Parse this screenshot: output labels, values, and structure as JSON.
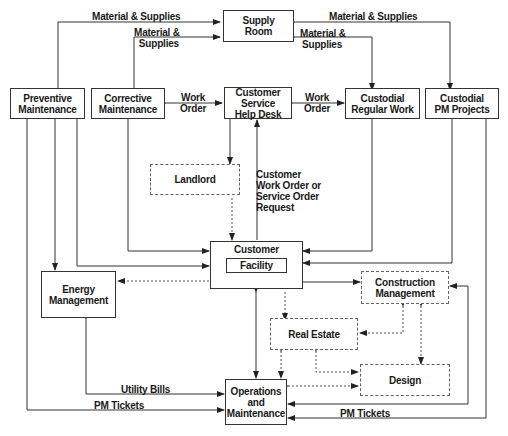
{
  "diagram": {
    "type": "flowchart",
    "nodes": {
      "supply_room": {
        "label_1": "Supply",
        "label_2": "Room",
        "style": "solid"
      },
      "preventive_maintenance": {
        "label_1": "Preventive",
        "label_2": "Maintenance",
        "style": "solid"
      },
      "corrective_maintenance": {
        "label_1": "Corrective",
        "label_2": "Maintenance",
        "style": "solid"
      },
      "help_desk": {
        "label_1": "Customer",
        "label_2": "Service",
        "label_3": "Help  Desk",
        "style": "solid"
      },
      "custodial_regular": {
        "label_1": "Custodial",
        "label_2": "Regular Work",
        "style": "solid"
      },
      "custodial_pm": {
        "label_1": "Custodial",
        "label_2": "PM Projects",
        "style": "solid"
      },
      "landlord": {
        "label": "Landlord",
        "style": "dotted"
      },
      "customer_facility": {
        "label": "Customer",
        "inner_label": "Facility",
        "style": "solid"
      },
      "energy_management": {
        "label_1": "Energy",
        "label_2": "Management",
        "style": "solid"
      },
      "construction_management": {
        "label_1": "Construction",
        "label_2": "Management",
        "style": "dotted"
      },
      "real_estate": {
        "label": "Real Estate",
        "style": "dotted"
      },
      "design": {
        "label": "Design",
        "style": "dotted"
      },
      "operations_maintenance": {
        "label_1": "Operations",
        "label_2": "and",
        "label_3": "Maintenance",
        "style": "solid"
      }
    },
    "edge_labels": {
      "material_supplies_top_left": "Material & Supplies",
      "material_supplies_mid_left_1": "Material &",
      "material_supplies_mid_left_2": "Supplies",
      "material_supplies_top_right": "Material & Supplies",
      "material_supplies_mid_right_1": "Material &",
      "material_supplies_mid_right_2": "Supplies",
      "work_order_left_1": "Work",
      "work_order_left_2": "Order",
      "work_order_right_1": "Work",
      "work_order_right_2": "Order",
      "customer_request_1": "Customer",
      "customer_request_2": "Work Order or",
      "customer_request_3": "Service Order",
      "customer_request_4": "Request",
      "utility_bills": "Utility Bills",
      "pm_tickets_left": "PM  Tickets",
      "pm_tickets_right": "PM  Tickets"
    },
    "edges": [
      {
        "from": "Supply Room",
        "to": "Preventive Maintenance",
        "label": "Material & Supplies",
        "bidirectional": true
      },
      {
        "from": "Supply Room",
        "to": "Corrective Maintenance",
        "label": "Material & Supplies",
        "bidirectional": true
      },
      {
        "from": "Supply Room",
        "to": "Custodial PM Projects",
        "label": "Material & Supplies",
        "bidirectional": true
      },
      {
        "from": "Supply Room",
        "to": "Custodial Regular Work",
        "label": "Material & Supplies",
        "bidirectional": true
      },
      {
        "from": "Corrective Maintenance",
        "to": "Customer Service Help Desk",
        "label": "Work Order",
        "bidirectional": true
      },
      {
        "from": "Customer Service Help Desk",
        "to": "Custodial Regular Work",
        "label": "Work Order",
        "bidirectional": true
      },
      {
        "from": "Customer Service Help Desk",
        "to": "Landlord"
      },
      {
        "from": "Landlord",
        "to": "Customer Facility",
        "dotted": true
      },
      {
        "from": "Customer Facility",
        "to": "Customer Service Help Desk",
        "label": "Customer Work Order or Service Order Request"
      },
      {
        "from": "Corrective Maintenance",
        "to": "Customer Facility"
      },
      {
        "from": "Preventive Maintenance",
        "to": "Customer Facility"
      },
      {
        "from": "Custodial Regular Work",
        "to": "Customer Facility"
      },
      {
        "from": "Custodial PM Projects",
        "to": "Customer Facility"
      },
      {
        "from": "Preventive Maintenance",
        "to": "Energy Management",
        "bidirectional": true
      },
      {
        "from": "Customer Facility",
        "to": "Energy Management",
        "dotted": true
      },
      {
        "from": "Customer Facility",
        "to": "Construction Management"
      },
      {
        "from": "Customer Facility",
        "to": "Real Estate",
        "dotted": true
      },
      {
        "from": "Customer Facility",
        "to": "Operations and Maintenance",
        "bidirectional": true
      },
      {
        "from": "Construction Management",
        "to": "Real Estate",
        "dotted": true
      },
      {
        "from": "Construction Management",
        "to": "Design",
        "dotted": true,
        "bidirectional": true
      },
      {
        "from": "Real Estate",
        "to": "Design",
        "dotted": true
      },
      {
        "from": "Real Estate",
        "to": "Operations and Maintenance",
        "dotted": true,
        "bidirectional": true
      },
      {
        "from": "Design",
        "to": "Operations and Maintenance",
        "dotted": true,
        "bidirectional": true
      },
      {
        "from": "Energy Management",
        "to": "Operations and Maintenance",
        "label": "Utility Bills",
        "bidirectional": true
      },
      {
        "from": "Preventive Maintenance",
        "to": "Operations and Maintenance",
        "label": "PM Tickets",
        "bidirectional": true
      },
      {
        "from": "Custodial PM Projects",
        "to": "Operations and Maintenance",
        "label": "PM Tickets",
        "bidirectional": true
      },
      {
        "from": "Construction Management",
        "to": "Operations and Maintenance"
      }
    ]
  }
}
